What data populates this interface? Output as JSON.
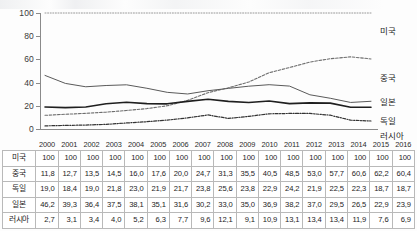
{
  "chart_data": {
    "type": "line",
    "title": "",
    "subtitle": "",
    "xlabel": "",
    "ylabel": "",
    "ylim": [
      0,
      100
    ],
    "yticks": [
      0,
      20,
      40,
      60,
      80,
      100
    ],
    "grid": false,
    "legend_position": "right",
    "x": [
      2000,
      2001,
      2002,
      2003,
      2004,
      2005,
      2006,
      2007,
      2008,
      2009,
      2010,
      2011,
      2012,
      2013,
      2014,
      2015,
      2016
    ],
    "categories": [
      "2000",
      "2001",
      "2002",
      "2003",
      "2004",
      "2005",
      "2006",
      "2007",
      "2008",
      "2009",
      "2010",
      "2011",
      "2012",
      "2013",
      "2014",
      "2015",
      "2016"
    ],
    "series": [
      {
        "name": "미국",
        "style": "dotted",
        "color": "#8c8c8c",
        "values": [
          100,
          100,
          100,
          100,
          100,
          100,
          100,
          100,
          100,
          100,
          100,
          100,
          100,
          100,
          100,
          100,
          100
        ]
      },
      {
        "name": "중국",
        "style": "dashed",
        "color": "#6e6e6e",
        "values": [
          11.8,
          12.7,
          13.5,
          14.5,
          16.0,
          17.6,
          20.0,
          24.7,
          31.3,
          35.5,
          40.5,
          48.5,
          53.0,
          57.7,
          60.6,
          62.2,
          60.4
        ]
      },
      {
        "name": "일본",
        "style": "solid-thin",
        "color": "#5a5a5a",
        "values": [
          46.2,
          39.3,
          36.4,
          37.5,
          38.1,
          35.1,
          31.6,
          30.2,
          33.0,
          35.0,
          36.9,
          38.2,
          37.0,
          29.5,
          26.5,
          22.9,
          23.9
        ]
      },
      {
        "name": "독일",
        "style": "solid-thick",
        "color": "#1f1f1f",
        "values": [
          19.0,
          18.4,
          19.0,
          21.8,
          23.0,
          21.9,
          21.7,
          23.8,
          25.6,
          23.8,
          22.9,
          24.2,
          21.9,
          22.5,
          22.3,
          18.7,
          18.7
        ]
      },
      {
        "name": "러시아",
        "style": "dash-dot",
        "color": "#343434",
        "values": [
          2.7,
          3.1,
          3.4,
          4.0,
          5.2,
          6.3,
          7.7,
          9.6,
          12.1,
          9.1,
          10.9,
          13.1,
          13.4,
          13.4,
          11.9,
          7.6,
          6.9
        ]
      }
    ]
  },
  "axis": {
    "y_ticks": [
      "100",
      "80",
      "60",
      "40",
      "20",
      "0"
    ]
  },
  "legend": {
    "items": [
      {
        "label": "미국"
      },
      {
        "label": "중국"
      },
      {
        "label": "일본"
      },
      {
        "label": "독일"
      },
      {
        "label": "러시아"
      }
    ]
  },
  "table": {
    "corner_label": "",
    "column_headers": [
      "2000",
      "2001",
      "2002",
      "2003",
      "2004",
      "2005",
      "2006",
      "2007",
      "2008",
      "2009",
      "2010",
      "2011",
      "2012",
      "2013",
      "2014",
      "2015",
      "2016"
    ],
    "rows": [
      {
        "label": "미국",
        "values": [
          "100",
          "100",
          "100",
          "100",
          "100",
          "100",
          "100",
          "100",
          "100",
          "100",
          "100",
          "100",
          "100",
          "100",
          "100",
          "100",
          "100"
        ]
      },
      {
        "label": "중국",
        "values": [
          "11,8",
          "12,7",
          "13,5",
          "14,5",
          "16,0",
          "17,6",
          "20,0",
          "24,7",
          "31,3",
          "35,5",
          "40,5",
          "48,5",
          "53,0",
          "57,7",
          "60,6",
          "62,2",
          "60,4"
        ]
      },
      {
        "label": "독일",
        "values": [
          "19,0",
          "18,4",
          "19,0",
          "21,8",
          "23,0",
          "21,9",
          "21,7",
          "23,8",
          "25,6",
          "23,8",
          "22,9",
          "24,2",
          "21,9",
          "22,5",
          "22,3",
          "18,7",
          "18,7"
        ]
      },
      {
        "label": "일본",
        "values": [
          "46,2",
          "39,3",
          "36,4",
          "37,5",
          "38,1",
          "35,1",
          "31,6",
          "30,2",
          "33,0",
          "35,0",
          "36,9",
          "38,2",
          "37,0",
          "29,5",
          "26,5",
          "22,9",
          "23,9"
        ]
      },
      {
        "label": "러시아",
        "values": [
          "2,7",
          "3,1",
          "3,4",
          "4,0",
          "5,2",
          "6,3",
          "7,7",
          "9,6",
          "12,1",
          "9,1",
          "10,9",
          "13,1",
          "13,4",
          "13,4",
          "11,9",
          "7,6",
          "6,9"
        ]
      }
    ]
  }
}
